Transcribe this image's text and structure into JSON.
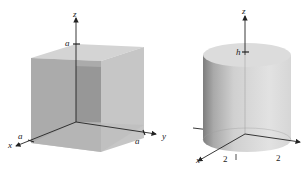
{
  "figures": [
    {
      "name": "cube",
      "axes": {
        "x": "x",
        "y": "y",
        "z": "z"
      },
      "labels": {
        "z_tick": "a",
        "x_tick": "a",
        "y_tick": "a"
      },
      "colors": {
        "front": "#a8a8a8",
        "right": "#c4c4c4",
        "top": "#d2d2d2",
        "inner": "#8e8e8e",
        "axis": "#222222"
      }
    },
    {
      "name": "cylinder",
      "axes": {
        "x": "x",
        "y": "y",
        "z": "z"
      },
      "labels": {
        "z_tick": "h",
        "x_tick": "2",
        "y_tick": "2"
      },
      "colors": {
        "body_light": "#d8d8d8",
        "body_dark": "#8a8a8a",
        "top": "#dcdcdc",
        "axis": "#222222"
      }
    }
  ]
}
